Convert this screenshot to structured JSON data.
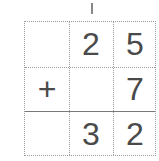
{
  "problem": {
    "type": "column-addition",
    "carry": "1",
    "rows": [
      [
        "",
        "2",
        "5"
      ],
      [
        "+",
        "",
        "7"
      ],
      [
        "",
        "3",
        "2"
      ]
    ]
  }
}
